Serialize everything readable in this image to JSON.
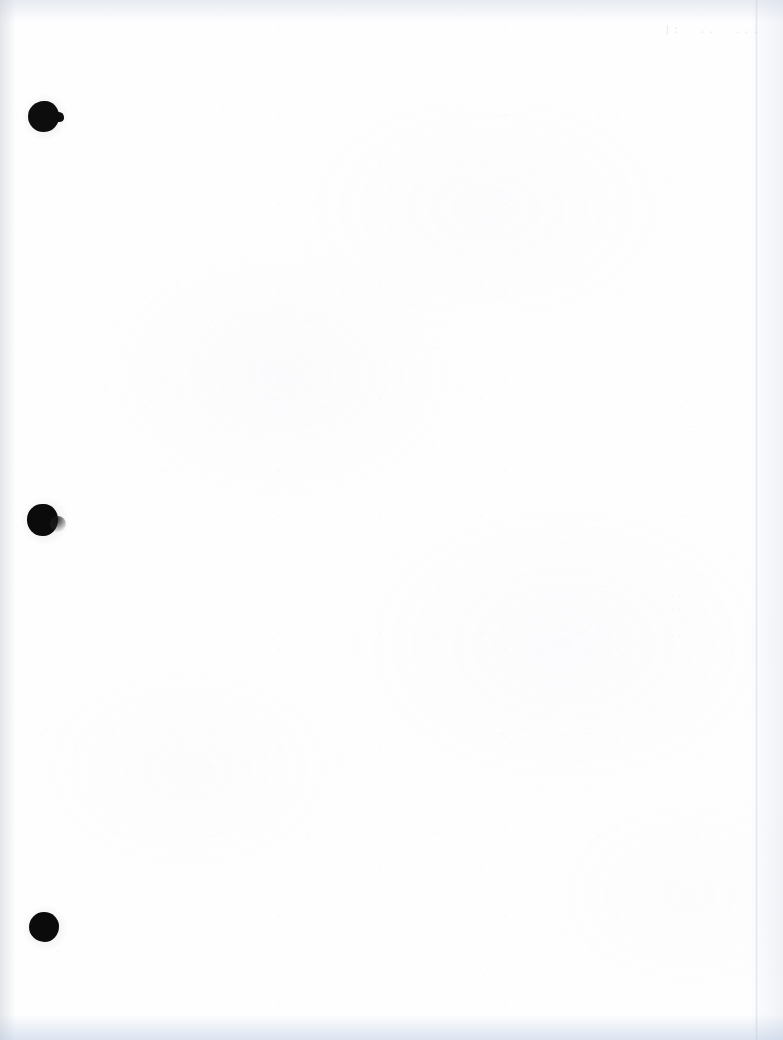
{
  "document": {
    "kind": "scanned-page",
    "page_state": "blank",
    "orientation": "portrait",
    "width_px": 783,
    "height_px": 1040,
    "paper_color": "#fefeff",
    "ink_color": "#0b0b0b"
  },
  "binder_holes": {
    "count": 3,
    "label": "three-hole punch",
    "items": [
      {
        "name": "top-hole",
        "x": 28,
        "y": 101,
        "diameter": 31,
        "shape": "irregular-with-nib"
      },
      {
        "name": "middle-hole",
        "x": 27,
        "y": 504,
        "diameter": 31,
        "shape": "irregular-with-smudge"
      },
      {
        "name": "bottom-hole",
        "x": 29,
        "y": 912,
        "diameter": 30,
        "shape": "round"
      }
    ]
  },
  "scan_artifacts": {
    "left_edge_shadow": "#bcc0c9",
    "top_edge_shadow": "#c4ccdc",
    "bottom_edge_shadow": "#b2c4de",
    "right_edge_shadow": "#c6d0e0",
    "page_edge_line_x": 755,
    "grain_tint": "#cbced6"
  },
  "ghost_text": {
    "note": "faint bleed-through from the reverse side; not legible",
    "stamp_top_right": "|:  ..  ...",
    "column_right_upper": ". .\n.  .\n..\n.  .\n.",
    "column_mid_left": ". ..  .",
    "column_mid_right": ". . .\n. .\n.  .\n. .",
    "band_middle": ".  ..   .    .",
    "band_lower": ".  . ..    .      . .   ..",
    "band_lower_right": ". ."
  }
}
